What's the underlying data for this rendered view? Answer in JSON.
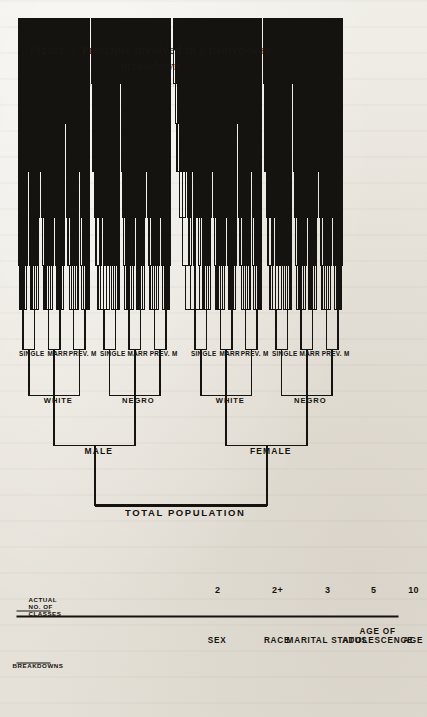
{
  "figure": {
    "caption": "Figure 3. Principle involved in a twelve-way breakdown",
    "caption_sub": "of a population into homogeneous subgroups"
  },
  "tree": {
    "root": "TOTAL POPULATION",
    "level1": [
      "MALE",
      "FEMALE"
    ],
    "level2": [
      "WHITE",
      "NEGRO"
    ],
    "level3": [
      "SINGLE",
      "MARR",
      "PREV. M"
    ],
    "accent": "#15130f"
  },
  "table": {
    "header_breakdowns": "BREAKDOWNS",
    "header_classes": "ACTUAL\nNO. OF\nCLASSES",
    "header_classes_lines": [
      "ACTUAL",
      "NO. OF",
      "CLASSES"
    ],
    "rows": [
      {
        "name": "SEX",
        "name_lines": [
          "SEX"
        ],
        "classes": "2"
      },
      {
        "name": "RACE",
        "name_lines": [
          "RACE"
        ],
        "classes": "2+"
      },
      {
        "name": "MARITAL STATUS",
        "name_lines": [
          "MARITAL STATUS"
        ],
        "classes": "3"
      },
      {
        "name": "AGE OF ADOLESCENCE",
        "name_lines": [
          "AGE OF",
          "ADOLESCENCE"
        ],
        "classes": "5"
      },
      {
        "name": "AGE",
        "name_lines": [
          "AGE"
        ],
        "classes": "10"
      },
      {
        "name": "EDUCATIONAL LEVEL",
        "name_lines": [
          "EDUCATIONAL",
          "LEVEL"
        ],
        "classes": "6"
      },
      {
        "name": "OCCUPATIONAL CLASS-SUBJECT",
        "name_lines": [
          "OCCUPATIONAL",
          "CLASS-SUBJECT"
        ],
        "classes": "9"
      },
      {
        "name": "OCCUPATIONAL CLASS-PARENT",
        "name_lines": [
          "OCCUPATIONAL",
          "CLASS-PARENT"
        ],
        "classes": "9"
      },
      {
        "name": "RELIGIOUS GROUP",
        "name_lines": [
          "RELIGIOUS GROUP"
        ],
        "classes": "3+"
      },
      {
        "name": "RELIGIOUS ADHERENCE",
        "name_lines": [
          "RELIGIOUS",
          "ADHERENCE"
        ],
        "classes": "4"
      },
      {
        "name": "RURAL-URBAN",
        "name_lines": [
          "RURAL-URBAN"
        ],
        "classes": "3+"
      }
    ]
  },
  "chart_data": {
    "type": "tree",
    "title": "Figure 3. Principle involved in a twelve-way breakdown",
    "orientation": "left-to-right (page rotated 90 degrees)",
    "root": "TOTAL POPULATION",
    "levels": [
      {
        "depth": 0,
        "breakdown": "",
        "classes": "",
        "labels": [
          "TOTAL POPULATION"
        ]
      },
      {
        "depth": 1,
        "breakdown": "SEX",
        "classes": "2",
        "labels": [
          "MALE",
          "FEMALE"
        ]
      },
      {
        "depth": 2,
        "breakdown": "RACE",
        "classes": "2+",
        "labels": [
          "WHITE",
          "NEGRO"
        ]
      },
      {
        "depth": 3,
        "breakdown": "MARITAL STATUS",
        "classes": "3",
        "labels": [
          "SINGLE",
          "MARR",
          "PREV. M"
        ]
      },
      {
        "depth": 4,
        "breakdown": "AGE OF ADOLESCENCE",
        "classes": "5",
        "labels": []
      },
      {
        "depth": 5,
        "breakdown": "AGE",
        "classes": "10",
        "labels": []
      },
      {
        "depth": 6,
        "breakdown": "EDUCATIONAL LEVEL",
        "classes": "6",
        "labels": []
      },
      {
        "depth": 7,
        "breakdown": "OCCUPATIONAL CLASS-SUBJECT",
        "classes": "9",
        "labels": []
      },
      {
        "depth": 8,
        "breakdown": "OCCUPATIONAL CLASS-PARENT",
        "classes": "9",
        "labels": []
      },
      {
        "depth": 9,
        "breakdown": "RELIGIOUS GROUP",
        "classes": "3+",
        "labels": []
      },
      {
        "depth": 10,
        "breakdown": "RELIGIOUS ADHERENCE",
        "classes": "4",
        "labels": []
      },
      {
        "depth": 11,
        "breakdown": "RURAL-URBAN",
        "classes": "3+",
        "labels": []
      }
    ],
    "note": "Schematic: only the first three breakdown levels are individually labelled; deeper levels are drawn as repeated fan-out brackets."
  }
}
